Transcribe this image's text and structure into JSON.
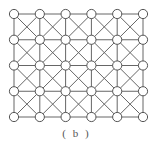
{
  "diagram": {
    "caption": "( b )",
    "grid": {
      "columns": 6,
      "rows": 5,
      "origin_x": 14,
      "origin_y": 14,
      "spacing_x": 25.8,
      "spacing_y": 25.75,
      "node_radius": 4.6
    },
    "edges": [
      "horizontal",
      "vertical",
      "diagonal-down",
      "diagonal-up"
    ],
    "colors": {
      "line": "#666666",
      "node_stroke": "#555555",
      "node_fill": "#ffffff"
    }
  }
}
